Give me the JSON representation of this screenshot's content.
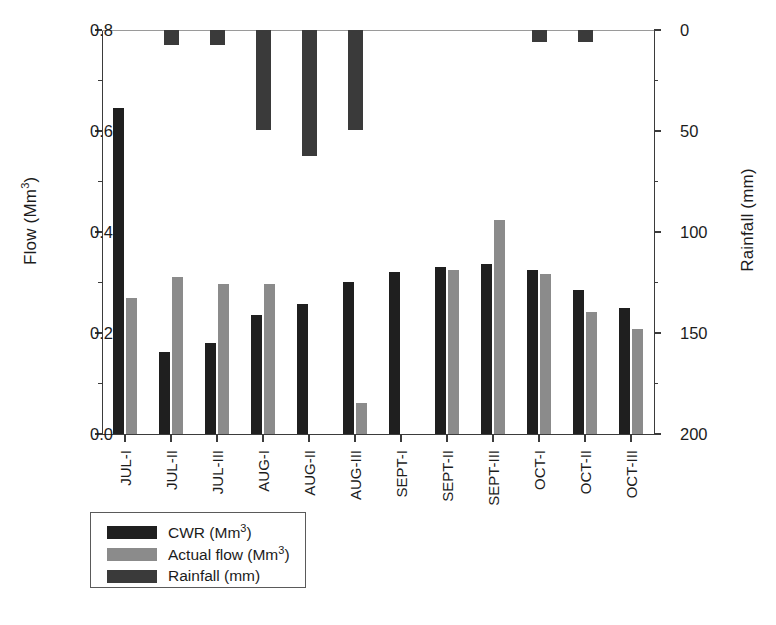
{
  "chart_data": {
    "type": "bar",
    "title": "",
    "subtitle": "",
    "xlabel": "",
    "ylabel": "Flow (Mm3)",
    "ylabel_base": "Flow (Mm",
    "ylabel_sup": "3",
    "ylabel_close": ")",
    "y2label": "Rainfall (mm)",
    "categories": [
      "JUL-I",
      "JUL-II",
      "JUL-III",
      "AUG-I",
      "AUG-II",
      "AUG-III",
      "SEPT-I",
      "SEPT-II",
      "SEPT-III",
      "OCT-I",
      "OCT-II",
      "OCT-III"
    ],
    "ylim": [
      0.0,
      0.8
    ],
    "y2lim": [
      0,
      200
    ],
    "y2_inverted": true,
    "yticks": [
      "0.0",
      "0.2",
      "0.4",
      "0.6",
      "0.8"
    ],
    "ytick_values": [
      0.0,
      0.2,
      0.4,
      0.6,
      0.8
    ],
    "y2ticks": [
      "0",
      "50",
      "100",
      "150",
      "200"
    ],
    "y2tick_values": [
      0,
      50,
      100,
      150,
      200
    ],
    "grid": false,
    "legend_position": "below-left",
    "series": [
      {
        "name": "CWR (Mm3)",
        "label_base": "CWR (Mm",
        "label_sup": "3",
        "label_close": ")",
        "axis": "left",
        "color": "#1f1f1f",
        "direction": "up",
        "values": [
          0.645,
          0.162,
          0.181,
          0.235,
          0.257,
          0.301,
          0.321,
          0.33,
          0.337,
          0.324,
          0.286,
          0.25
        ]
      },
      {
        "name": "Actual flow (Mm3)",
        "label_base": "Actual flow (Mm",
        "label_sup": "3",
        "label_close": ")",
        "axis": "left",
        "color": "#8b8b8b",
        "direction": "up",
        "values": [
          0.27,
          0.311,
          0.297,
          0.297,
          0.0,
          0.062,
          0.0,
          0.325,
          0.423,
          0.316,
          0.241,
          0.208
        ]
      },
      {
        "name": "Rainfall (mm)",
        "label_base": "Rainfall (mm)",
        "label_sup": "",
        "label_close": "",
        "axis": "right",
        "color": "#3a3a3a",
        "direction": "down",
        "values": [
          0,
          7.5,
          7.5,
          49.5,
          62.5,
          49.5,
          0,
          0,
          0,
          6.0,
          6.0,
          0
        ]
      }
    ]
  }
}
